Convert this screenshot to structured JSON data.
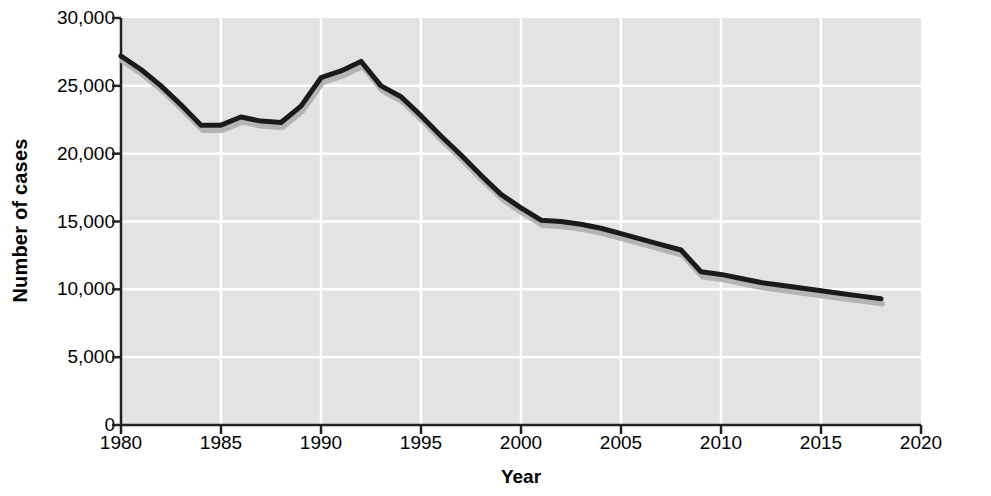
{
  "chart_data": {
    "type": "line",
    "title": "",
    "xlabel": "Year",
    "ylabel": "Number of cases",
    "xlim": [
      1980,
      2020
    ],
    "ylim": [
      0,
      30000
    ],
    "xticks": [
      1980,
      1985,
      1990,
      1995,
      2000,
      2005,
      2010,
      2015,
      2020
    ],
    "xtick_labels": [
      "1980",
      "1985",
      "1990",
      "1995",
      "2000",
      "2005",
      "2010",
      "2015",
      "2020"
    ],
    "yticks": [
      0,
      5000,
      10000,
      15000,
      20000,
      25000,
      30000
    ],
    "ytick_labels": [
      "0",
      "5,000",
      "10,000",
      "15,000",
      "20,000",
      "25,000",
      "30,000"
    ],
    "grid": true,
    "grid_color": "#ffffff",
    "plot_background": "#e3e3e3",
    "line_color": "#1a1a1a",
    "shadow_color": "#b4b4b4",
    "line_width": 5,
    "legend": null,
    "x": [
      1980,
      1981,
      1982,
      1983,
      1984,
      1985,
      1986,
      1987,
      1988,
      1989,
      1990,
      1991,
      1992,
      1993,
      1994,
      1995,
      1996,
      1997,
      1998,
      1999,
      2000,
      2001,
      2002,
      2003,
      2004,
      2005,
      2006,
      2007,
      2008,
      2009,
      2010,
      2011,
      2012,
      2013,
      2014,
      2015,
      2016,
      2017,
      2018
    ],
    "series": [
      {
        "name": "Number of cases",
        "values": [
          27200,
          26200,
          25000,
          23600,
          22100,
          22100,
          22700,
          22400,
          22300,
          23500,
          25600,
          26100,
          26800,
          25000,
          24200,
          22800,
          21300,
          19900,
          18400,
          17000,
          16000,
          15100,
          15000,
          14800,
          14500,
          14100,
          13700,
          13300,
          12900,
          11300,
          11100,
          10800,
          10500,
          10300,
          10100,
          9900,
          9700,
          9500,
          9300
        ]
      }
    ]
  }
}
